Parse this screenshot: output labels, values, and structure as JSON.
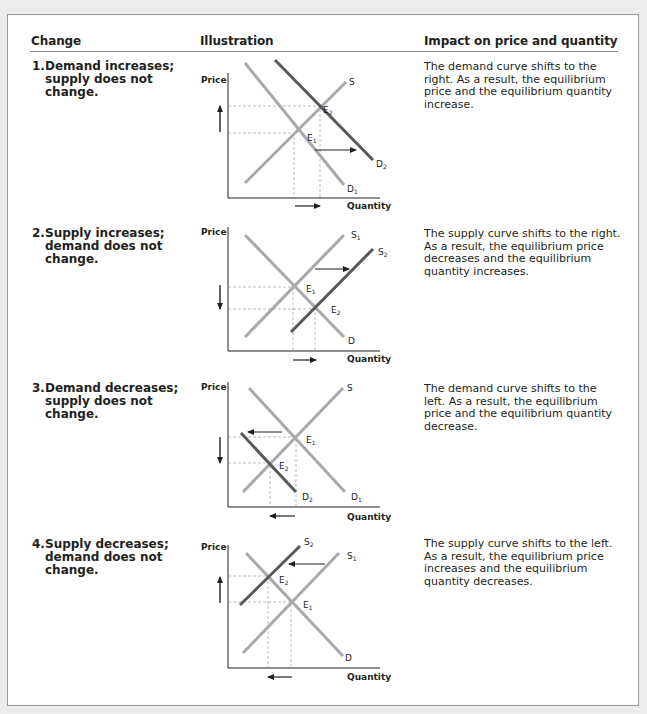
{
  "headers": {
    "change": "Change",
    "illustration": "Illustration",
    "impact": "Impact on price and quantity"
  },
  "rows": [
    {
      "number": "1.",
      "change_lines": [
        "Demand increases;",
        "supply does not",
        "change."
      ],
      "impact_lines": [
        "The demand curve shifts to the",
        "right. As a result, the equilibrium",
        "price and the equilibrium quantity",
        "increase."
      ],
      "chart": {
        "y_label": "Price",
        "x_label": "Quantity",
        "curves": [
          "S",
          "D1",
          "D2"
        ],
        "points": [
          "E1",
          "E2"
        ],
        "shift": "demand right",
        "price_change": "up",
        "quantity_change": "right"
      }
    },
    {
      "number": "2.",
      "change_lines": [
        "Supply increases;",
        "demand does not",
        "change."
      ],
      "impact_lines": [
        "The supply curve shifts to the right.",
        "As a result, the equilibrium price",
        "decreases and the equilibrium",
        "quantity increases."
      ],
      "chart": {
        "y_label": "Price",
        "x_label": "Quantity",
        "curves": [
          "S1",
          "S2",
          "D"
        ],
        "points": [
          "E1",
          "E2"
        ],
        "shift": "supply right",
        "price_change": "down",
        "quantity_change": "right"
      }
    },
    {
      "number": "3.",
      "change_lines": [
        "Demand decreases;",
        "supply does not",
        "change."
      ],
      "impact_lines": [
        "The demand curve shifts to the",
        "left. As a result, the equilibrium",
        "price and the equilibrium quantity",
        "decrease."
      ],
      "chart": {
        "y_label": "Price",
        "x_label": "Quantity",
        "curves": [
          "S",
          "D1",
          "D2"
        ],
        "points": [
          "E1",
          "E2"
        ],
        "shift": "demand left",
        "price_change": "down",
        "quantity_change": "left"
      }
    },
    {
      "number": "4.",
      "change_lines": [
        "Supply decreases;",
        "demand does not",
        "change."
      ],
      "impact_lines": [
        "The supply curve shifts to the left.",
        "As a result, the equilibrium price",
        "increases and the equilibrium",
        "quantity decreases."
      ],
      "chart": {
        "y_label": "Price",
        "x_label": "Quantity",
        "curves": [
          "S1",
          "S2",
          "D"
        ],
        "points": [
          "E1",
          "E2"
        ],
        "shift": "supply left",
        "price_change": "up",
        "quantity_change": "left"
      }
    }
  ],
  "colors": {
    "original_curve": "#a7a9ac",
    "shifted_curve": "#58595b",
    "text": "#231f20",
    "guide": "#9d9fa2"
  }
}
